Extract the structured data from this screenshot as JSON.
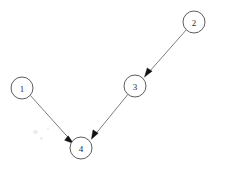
{
  "diagram": {
    "type": "directed-graph",
    "width": 227,
    "height": 171,
    "background_color": "#ffffff",
    "node_stroke_color": "#5d5d5d",
    "node_fill_color": "#ffffff",
    "edge_color": "#6e6e6e",
    "arrow_color": "#121212",
    "label_color": "#2b2b2b",
    "node_radius": 11,
    "nodes": [
      {
        "id": "1",
        "label": "1",
        "cx": 22,
        "cy": 88
      },
      {
        "id": "2",
        "label": "2",
        "cx": 194,
        "cy": 22
      },
      {
        "id": "3",
        "label": "3",
        "cx": 135,
        "cy": 86
      },
      {
        "id": "4",
        "label": "4",
        "cx": 81,
        "cy": 148
      }
    ],
    "edges": [
      {
        "id": "edge-1-4",
        "from": "1",
        "to": "4",
        "directed": true
      },
      {
        "id": "edge-2-3",
        "from": "2",
        "to": "3",
        "directed": true
      },
      {
        "id": "edge-3-4",
        "from": "3",
        "to": "4",
        "directed": true
      }
    ]
  }
}
